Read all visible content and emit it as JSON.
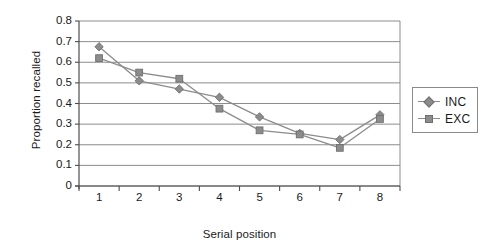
{
  "chart_data": {
    "type": "line",
    "title": "",
    "xlabel": "Serial position",
    "ylabel": "Proportion recalled",
    "categories": [
      "1",
      "2",
      "3",
      "4",
      "5",
      "6",
      "7",
      "8"
    ],
    "x": [
      1,
      2,
      3,
      4,
      5,
      6,
      7,
      8
    ],
    "series": [
      {
        "name": "INC",
        "marker": "diamond",
        "color": "#8c8c8c",
        "values": [
          0.675,
          0.51,
          0.47,
          0.43,
          0.335,
          0.255,
          0.225,
          0.345
        ]
      },
      {
        "name": "EXC",
        "marker": "square",
        "color": "#8c8c8c",
        "values": [
          0.62,
          0.55,
          0.52,
          0.375,
          0.27,
          0.25,
          0.185,
          0.325
        ]
      }
    ],
    "ylim": [
      0,
      0.8
    ],
    "ytick_labels": [
      "0.8",
      "0.7",
      "0.6",
      "0.5",
      "0.4",
      "0.3",
      "0.2",
      "0.1",
      "0"
    ],
    "ytick_values": [
      0.8,
      0.7,
      0.6,
      0.5,
      0.4,
      0.3,
      0.2,
      0.1,
      0
    ],
    "xlim": [
      0.5,
      8.5
    ],
    "grid": "horizontal",
    "legend_position": "right",
    "legend_entries": [
      "INC",
      "EXC"
    ]
  },
  "style": {
    "grid_color": "#8c8c8c",
    "axis_color": "#4d4d4d",
    "series_color": "#8c8c8c",
    "marker_color": "#8c8c8c",
    "marker_edge_color": "#6f6f6f",
    "text_color": "#1a1a1a",
    "background": "#ffffff"
  }
}
